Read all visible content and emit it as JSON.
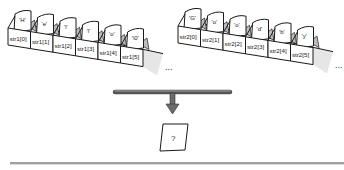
{
  "diagram": {
    "arrays": [
      {
        "name": "str1",
        "cells": [
          {
            "index_label": "str1[0]",
            "char": "'H'"
          },
          {
            "index_label": "str1[1]",
            "char": "'e'"
          },
          {
            "index_label": "str1[2]",
            "char": "'l'"
          },
          {
            "index_label": "str1[3]",
            "char": "'l'"
          },
          {
            "index_label": "str1[4]",
            "char": "'o'"
          },
          {
            "index_label": "str1[5]",
            "char": "'\\0'"
          }
        ],
        "continuation": "..."
      },
      {
        "name": "str2",
        "cells": [
          {
            "index_label": "str2[0]",
            "char": "'G'"
          },
          {
            "index_label": "str2[1]",
            "char": "'o'"
          },
          {
            "index_label": "str2[2]",
            "char": "'o'"
          },
          {
            "index_label": "str2[3]",
            "char": "'d'"
          },
          {
            "index_label": "str2[4]",
            "char": "'b'"
          },
          {
            "index_label": "str2[5]",
            "char": "'y'"
          }
        ],
        "continuation": "..."
      }
    ],
    "result": {
      "label": "?"
    },
    "colors": {
      "stroke": "#1a1a1a",
      "shade": "#bdbdbd",
      "arrow": "#6b6b6b",
      "rule": "#9a9a9a"
    }
  }
}
